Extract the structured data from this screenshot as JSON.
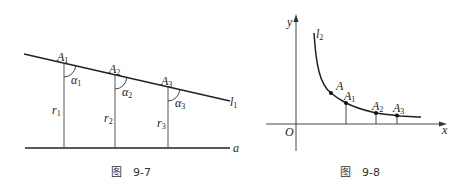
{
  "figures": [
    {
      "caption": {
        "char": "图",
        "number": "9-7"
      },
      "line_label": "l",
      "line_sub": "1",
      "base_label": "a",
      "points": [
        {
          "label": "A",
          "sub": "1",
          "angle": "α",
          "angle_sub": "1",
          "seg": "r",
          "seg_sub": "1"
        },
        {
          "label": "A",
          "sub": "2",
          "angle": "α",
          "angle_sub": "2",
          "seg": "r",
          "seg_sub": "2"
        },
        {
          "label": "A",
          "sub": "3",
          "angle": "α",
          "angle_sub": "3",
          "seg": "r",
          "seg_sub": "3"
        }
      ]
    },
    {
      "caption": {
        "char": "图",
        "number": "9-8"
      },
      "curve_label": "l",
      "curve_sub": "2",
      "x_axis": "x",
      "y_axis": "y",
      "origin": "O",
      "points": [
        {
          "label": "A",
          "sub": ""
        },
        {
          "label": "A",
          "sub": "1"
        },
        {
          "label": "A",
          "sub": "2"
        },
        {
          "label": "A",
          "sub": "3"
        }
      ]
    }
  ]
}
